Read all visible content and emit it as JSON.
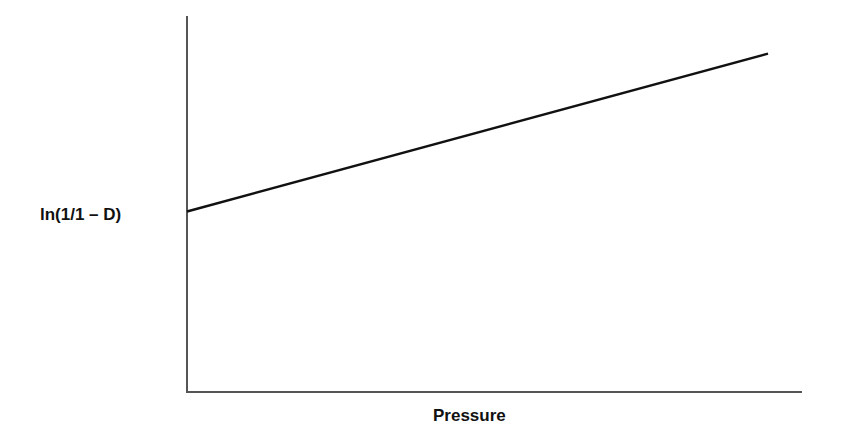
{
  "chart_data": {
    "type": "line",
    "title": "",
    "xlabel": "Pressure",
    "ylabel": "ln(1/1 – D)",
    "grid": false,
    "legend": null,
    "x_ticks": [],
    "y_ticks": [],
    "series": [
      {
        "name": "ln(1/1 – D) vs Pressure",
        "x": [
          0,
          1
        ],
        "y": [
          0.48,
          0.9
        ],
        "note": "Schematic linear relation with positive intercept; axes unlabeled numerically (normalized 0–1)."
      }
    ],
    "xlim": [
      0,
      1
    ],
    "ylim": [
      0,
      1
    ]
  },
  "colors": {
    "axis": "#555555",
    "line": "#111111",
    "text": "#111111"
  }
}
